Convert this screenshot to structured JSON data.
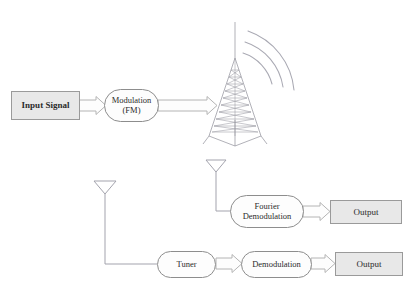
{
  "diagram": {
    "colors": {
      "box_fill": "#e8e8e8",
      "box_border": "#9a9a9a",
      "oval_fill": "#fdfdfd",
      "oval_border": "#8d8d8d",
      "line": "#9c9c9c",
      "arrow_outline": "#b0b0b0",
      "text": "#2b2b2b",
      "tower": "#8f8f9a",
      "wave": "#a6a6b0",
      "page_background": "#ffffff"
    },
    "cropped_header_text": "",
    "nodes": {
      "input_signal": {
        "label": "Input Signal",
        "shape": "rectangle"
      },
      "modulation": {
        "label_line1": "Modulation",
        "label_line2": "(FM)",
        "shape": "rounded"
      },
      "tower": {
        "label": "transmission-tower",
        "shape": "lattice-tower",
        "wave_arcs": 3
      },
      "antenna_upper": {
        "label": "receiving-antenna",
        "shape": "triangle-antenna"
      },
      "antenna_lower": {
        "label": "receiving-antenna",
        "shape": "triangle-antenna"
      },
      "fourier_demodulation": {
        "label_line1": "Fourier",
        "label_line2": "Demodulation",
        "shape": "rounded"
      },
      "output_upper": {
        "label": "Output",
        "shape": "rectangle"
      },
      "tuner": {
        "label": "Tuner",
        "shape": "rounded"
      },
      "demodulation": {
        "label": "Demodulation",
        "shape": "rounded"
      },
      "output_lower": {
        "label": "Output",
        "shape": "rectangle"
      }
    },
    "connections": [
      {
        "from": "input_signal",
        "to": "modulation",
        "style": "block-arrow"
      },
      {
        "from": "modulation",
        "to": "tower",
        "style": "block-arrow"
      },
      {
        "from": "tower",
        "to": "antenna_upper",
        "style": "radio-waves"
      },
      {
        "from": "antenna_upper",
        "to": "fourier_demodulation",
        "style": "plain-line"
      },
      {
        "from": "fourier_demodulation",
        "to": "output_upper",
        "style": "block-arrow"
      },
      {
        "from": "antenna_lower",
        "to": "tuner",
        "style": "plain-line"
      },
      {
        "from": "tuner",
        "to": "demodulation",
        "style": "block-arrow"
      },
      {
        "from": "demodulation",
        "to": "output_lower",
        "style": "block-arrow"
      }
    ]
  }
}
